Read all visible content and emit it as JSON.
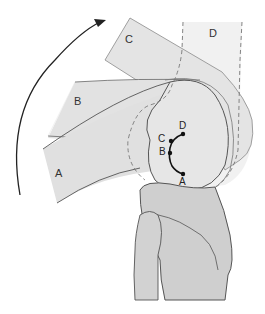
{
  "diagram": {
    "title": "",
    "positions": [
      {
        "id": "A",
        "label": "A"
      },
      {
        "id": "B",
        "label": "B"
      },
      {
        "id": "C",
        "label": "C"
      },
      {
        "id": "D",
        "label": "D"
      }
    ],
    "path_labels": [
      {
        "id": "D",
        "label": "D"
      },
      {
        "id": "C",
        "label": "C"
      },
      {
        "id": "B",
        "label": "B"
      },
      {
        "id": "A",
        "label": "A"
      }
    ],
    "arrow": "curved-rotation-arrow",
    "colors": {
      "fill_light": "#e2e2e2",
      "fill_lighter": "#eeeeee",
      "bone_fill": "#cfcfcf",
      "stroke": "#555555",
      "dashed_stroke": "#777777",
      "arrow": "#222222"
    }
  }
}
